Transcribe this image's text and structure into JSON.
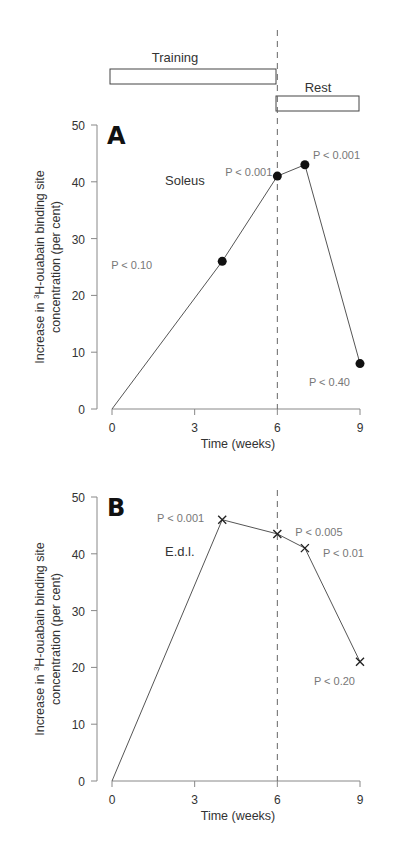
{
  "header": {
    "training_label": "Training",
    "rest_label": "Rest"
  },
  "chart_data": [
    {
      "type": "line",
      "panel": "A",
      "title": "Soleus",
      "xlabel": "Time (weeks)",
      "ylabel_line1": "Increase in ³H-ouabain binding site",
      "ylabel_line2": "concentration (per cent)",
      "x": [
        0,
        4,
        6,
        7,
        9
      ],
      "values": [
        0,
        26,
        41,
        43,
        8
      ],
      "marker": "circle",
      "annotations": [
        "",
        "P < 0.10",
        "P < 0.001",
        "P < 0.001",
        "P < 0.40"
      ],
      "xticks": [
        "0",
        "3",
        "6",
        "9"
      ],
      "yticks": [
        "0",
        "10",
        "20",
        "30",
        "40",
        "50"
      ],
      "xlim": [
        0,
        9
      ],
      "ylim": [
        0,
        50
      ],
      "vline_x": 6
    },
    {
      "type": "line",
      "panel": "B",
      "title": "E.d.l.",
      "xlabel": "Time (weeks)",
      "ylabel_line1": "Increase in ³H-ouabain binding site",
      "ylabel_line2": "concentration (per cent)",
      "x": [
        0,
        4,
        6,
        7,
        9
      ],
      "values": [
        0,
        46,
        43.5,
        41,
        21
      ],
      "marker": "x",
      "annotations": [
        "",
        "P < 0.001",
        "P < 0.005",
        "P < 0.01",
        "P < 0.20"
      ],
      "xticks": [
        "0",
        "3",
        "6",
        "9"
      ],
      "yticks": [
        "0",
        "10",
        "20",
        "30",
        "40",
        "50"
      ],
      "xlim": [
        0,
        9
      ],
      "ylim": [
        0,
        50
      ],
      "vline_x": 6
    }
  ]
}
